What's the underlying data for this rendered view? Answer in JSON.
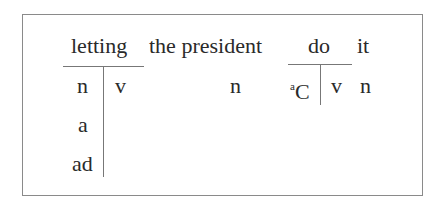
{
  "diagram": {
    "words": [
      {
        "text": "letting"
      },
      {
        "text": "the president"
      },
      {
        "text": "do"
      },
      {
        "text": "it"
      }
    ],
    "letting": {
      "left_column": [
        "n",
        "a",
        "ad"
      ],
      "right_column": [
        "v"
      ]
    },
    "the_president": {
      "tag": "n"
    },
    "do": {
      "left_superscript": "a",
      "left_label": "C",
      "right_label": "v"
    },
    "it": {
      "tag": "n"
    }
  }
}
